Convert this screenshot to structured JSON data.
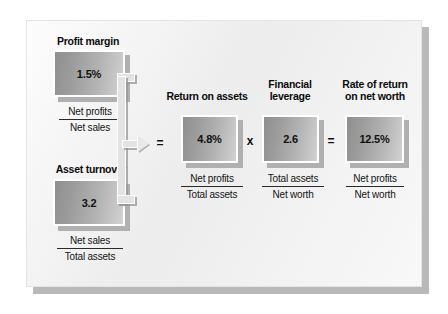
{
  "diagram": {
    "title_present": false,
    "blocks": [
      {
        "id": "profit-margin",
        "heading": "Profit margin",
        "value": "1.5%",
        "numerator": "Net profits",
        "denominator": "Net sales"
      },
      {
        "id": "asset-turnover",
        "heading": "Asset turnover",
        "value": "3.2",
        "numerator": "Net sales",
        "denominator": "Total assets"
      },
      {
        "id": "return-on-assets",
        "heading": "Return on assets",
        "value": "4.8%",
        "numerator": "Net profits",
        "denominator": "Total assets"
      },
      {
        "id": "financial-leverage",
        "heading": "Financial\nleverage",
        "value": "2.6",
        "numerator": "Total assets",
        "denominator": "Net worth"
      },
      {
        "id": "rate-of-return-on-net-worth",
        "heading": "Rate of return\non net worth",
        "value": "12.5%",
        "numerator": "Net profits",
        "denominator": "Net worth"
      }
    ],
    "operators": {
      "equals_left": "=",
      "times": "x",
      "equals_right": "="
    },
    "colors": {
      "panel_background": "#eeeeee",
      "page_background": "#ffffff",
      "box_gradient_dark": "#8f8f8f",
      "box_gradient_light": "#d2d2d2",
      "box_border": "#ffffff",
      "shadow": "#b0b0b0",
      "text": "#111111",
      "rule": "#2a2a2a"
    }
  }
}
